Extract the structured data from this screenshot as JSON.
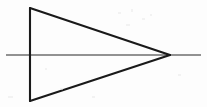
{
  "figure": {
    "canvas": {
      "width": 207,
      "height": 107
    },
    "background_color": "#fdfdfd",
    "stroke_color_shape": "#1a1a1a",
    "stroke_color_axis": "#6e6e6e",
    "stroke_width_shape": 2.1,
    "stroke_width_axis": 1.5
  },
  "chart_data": {
    "type": "diagram",
    "elements": [
      {
        "name": "triangle",
        "kind": "polygon",
        "closed": true,
        "points": [
          [
            30,
            8
          ],
          [
            170,
            55
          ],
          [
            30,
            101
          ]
        ],
        "stroke": "#1a1a1a",
        "stroke_width": 2.1,
        "fill": "none"
      },
      {
        "name": "horizontal-axis-line",
        "kind": "line",
        "points": [
          [
            6,
            55
          ],
          [
            201,
            55
          ]
        ],
        "stroke": "#6e6e6e",
        "stroke_width": 1.5
      }
    ],
    "vertices": [
      {
        "label": "top-left-vertex",
        "x": 30,
        "y": 8
      },
      {
        "label": "bottom-left-vertex",
        "x": 30,
        "y": 101
      },
      {
        "label": "right-apex-vertex",
        "x": 170,
        "y": 55
      }
    ],
    "segments": [
      {
        "label": "left-vertical-edge",
        "from": [
          30,
          8
        ],
        "to": [
          30,
          101
        ]
      },
      {
        "label": "upper-diagonal-edge",
        "from": [
          30,
          8
        ],
        "to": [
          170,
          55
        ]
      },
      {
        "label": "lower-diagonal-edge",
        "from": [
          30,
          101
        ],
        "to": [
          170,
          55
        ]
      },
      {
        "label": "horizontal-line",
        "from": [
          6,
          55
        ],
        "to": [
          201,
          55
        ]
      }
    ],
    "xlim": [
      0,
      207
    ],
    "ylim": [
      0,
      107
    ],
    "grid": false,
    "legend": null,
    "annotations": []
  }
}
